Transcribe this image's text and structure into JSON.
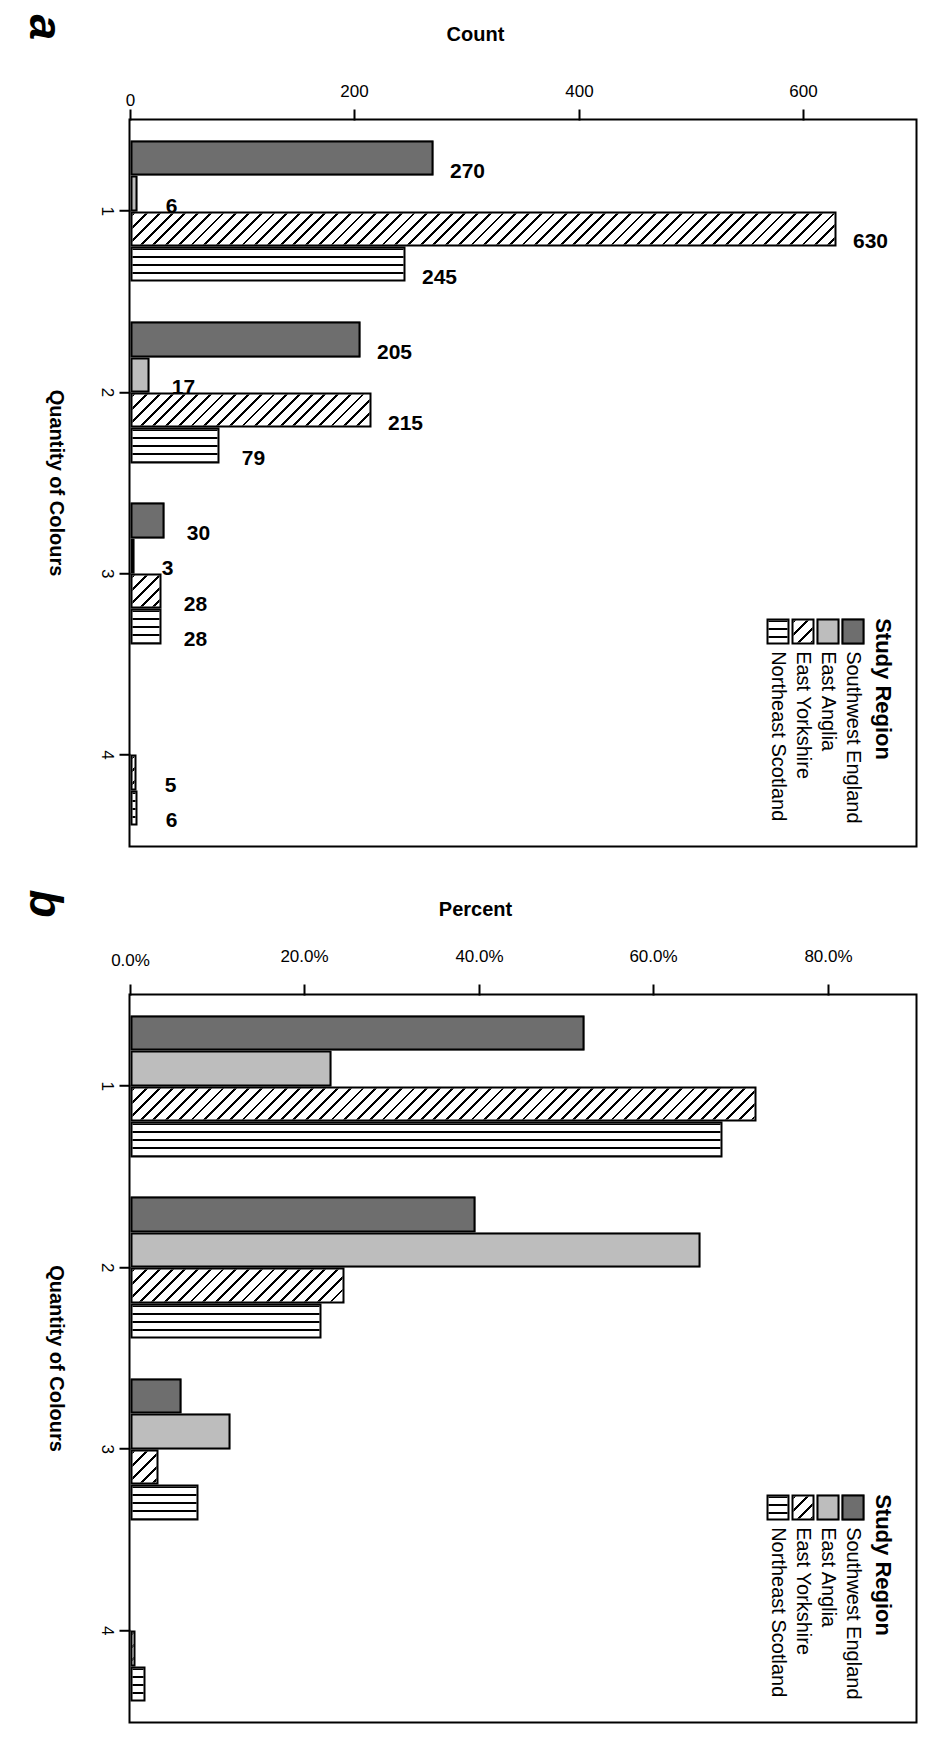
{
  "figure": {
    "panels": [
      {
        "letter": "a",
        "ytitle": "Count",
        "xtitle": "Quantity of Colours",
        "yticks": [
          "0",
          "200",
          "400",
          "600"
        ]
      },
      {
        "letter": "b",
        "ytitle": "Percent",
        "xtitle": "Quantity of Colours",
        "yticks": [
          "0.0%",
          "20.0%",
          "40.0%",
          "60.0%",
          "80.0%"
        ]
      }
    ]
  },
  "legend": {
    "title": "Study Region",
    "items": [
      {
        "label": "Southwest England",
        "key": "sw",
        "color": "#6e6e6e",
        "pattern": "solid-dark-grey"
      },
      {
        "label": "East Anglia",
        "key": "ea",
        "color": "#bdbdbd",
        "pattern": "solid-light-grey"
      },
      {
        "label": "East Yorkshire",
        "key": "ey",
        "color": "#ffffff",
        "pattern": "diagonal-hatch"
      },
      {
        "label": "Northeast Scotland",
        "key": "nes",
        "color": "#ffffff",
        "pattern": "vertical-hatch"
      }
    ]
  },
  "chart_data": [
    {
      "type": "bar",
      "panel": "a",
      "title": "",
      "xlabel": "Quantity of Colours",
      "ylabel": "Count",
      "categories": [
        "1",
        "2",
        "3",
        "4"
      ],
      "ylim": [
        0,
        700
      ],
      "yticks": [
        0,
        200,
        400,
        600
      ],
      "grid": false,
      "legend_position": "top-right",
      "series": [
        {
          "name": "Southwest England",
          "values": [
            270,
            205,
            30,
            0
          ],
          "labels": [
            "270",
            "205",
            "30",
            ""
          ]
        },
        {
          "name": "East Anglia",
          "values": [
            6,
            17,
            3,
            0
          ],
          "labels": [
            "6",
            "17",
            "3",
            ""
          ]
        },
        {
          "name": "East Yorkshire",
          "values": [
            630,
            215,
            28,
            5
          ],
          "labels": [
            "630",
            "215",
            "28",
            "5"
          ]
        },
        {
          "name": "Northeast Scotland",
          "values": [
            245,
            79,
            28,
            6
          ],
          "labels": [
            "245",
            "79",
            "28",
            "6"
          ]
        }
      ]
    },
    {
      "type": "bar",
      "panel": "b",
      "title": "",
      "xlabel": "Quantity of Colours",
      "ylabel": "Percent",
      "categories": [
        "1",
        "2",
        "3",
        "4"
      ],
      "ylim": [
        0,
        90
      ],
      "yticks": [
        0,
        20,
        40,
        60,
        80
      ],
      "grid": false,
      "legend_position": "top-right",
      "series": [
        {
          "name": "Southwest England",
          "values": [
            52.0,
            39.5,
            5.8,
            0.0
          ]
        },
        {
          "name": "East Anglia",
          "values": [
            23.1,
            65.4,
            11.5,
            0.0
          ]
        },
        {
          "name": "East Yorkshire",
          "values": [
            71.8,
            24.5,
            3.2,
            0.6
          ]
        },
        {
          "name": "Northeast Scotland",
          "values": [
            67.9,
            21.9,
            7.8,
            1.7
          ]
        }
      ]
    }
  ]
}
